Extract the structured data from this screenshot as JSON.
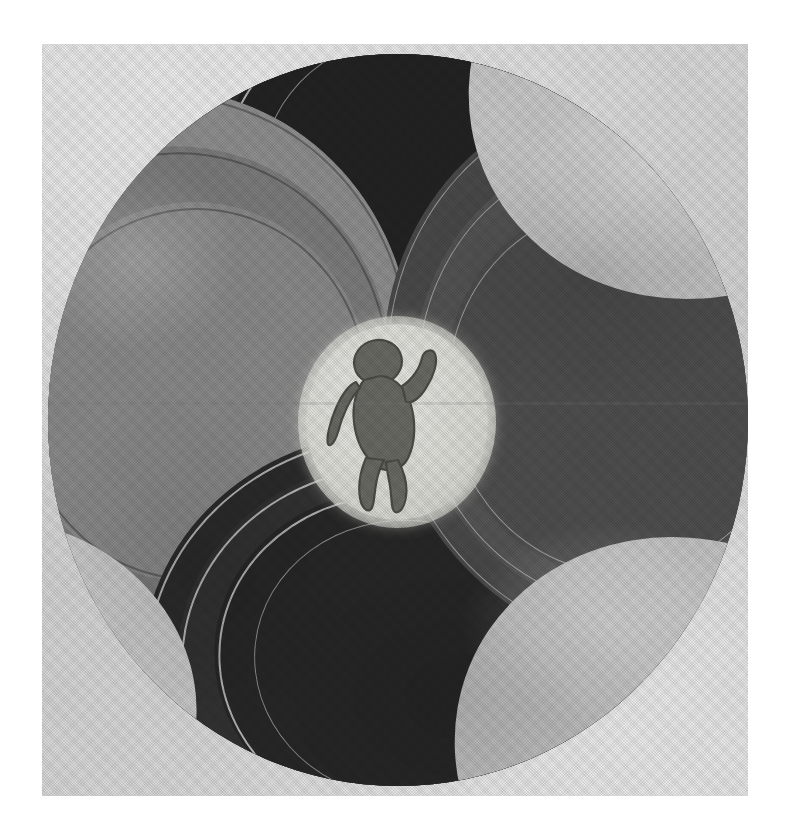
{
  "artwork": {
    "title": "Spiral Disc with Infant",
    "medium": "halftone letterpress reproduction",
    "form": "circular mandala / pinwheel composition",
    "alt_text": "A circular pinwheel composition of nested curved spiral arms in black, dark gray, mid gray and pale gray, radiating counterclockwise around a small pale circle at the centre which contains the silhouette of a naked infant with one arm raised.",
    "background_color": "#ffffff",
    "paper_color": "#d9d9d9",
    "plate": {
      "x": 42,
      "y": 44,
      "width": 706,
      "height": 752
    },
    "disc": {
      "center_x": 396,
      "center_y": 420,
      "radius": 350
    },
    "core": {
      "label": "central light circle",
      "center_x": 389,
      "center_y": 422,
      "radius": 91,
      "fill_color": "#e2e2dc"
    },
    "figure": {
      "label": "infant silhouette",
      "description": "naked baby, rounded head, right arm raised and bent, left arm hanging, legs bent as if walking",
      "ink_color": "#5e5e58"
    },
    "palette": {
      "black": "#262626",
      "dark_gray": "#343434",
      "mid_gray": "#7c7c7c",
      "gray": "#9c9c9c",
      "light_gray": "#c6c6c6",
      "pale": "#e2e2dc",
      "stroke_light": "#ebebeb"
    },
    "arms": [
      {
        "name": "arm-black-upper",
        "tone": "black",
        "color": "#262626",
        "start_angle_deg": 250,
        "sweep_deg": 135
      },
      {
        "name": "arm-dark-right",
        "tone": "dark_gray",
        "color": "#343434",
        "start_angle_deg": 340,
        "sweep_deg": 130
      },
      {
        "name": "arm-black-lower",
        "tone": "black",
        "color": "#2b2b2b",
        "start_angle_deg": 60,
        "sweep_deg": 135
      },
      {
        "name": "arm-gray-left",
        "tone": "gray",
        "color": "#9c9c9c",
        "start_angle_deg": 150,
        "sweep_deg": 120
      },
      {
        "name": "arm-light-topright",
        "tone": "light_gray",
        "color": "#c6c6c6",
        "start_angle_deg": 300,
        "sweep_deg": 70
      },
      {
        "name": "arm-light-bottomright",
        "tone": "light_gray",
        "color": "#c2c2c2",
        "start_angle_deg": 20,
        "sweep_deg": 70
      }
    ],
    "separator_strokes": {
      "count": 14,
      "color": "#ebebeb",
      "description": "thin pale arcs dividing each spiral arm into nested bands"
    },
    "symmetry": {
      "type": "rotational",
      "order": 3,
      "direction": "counterclockwise"
    }
  }
}
